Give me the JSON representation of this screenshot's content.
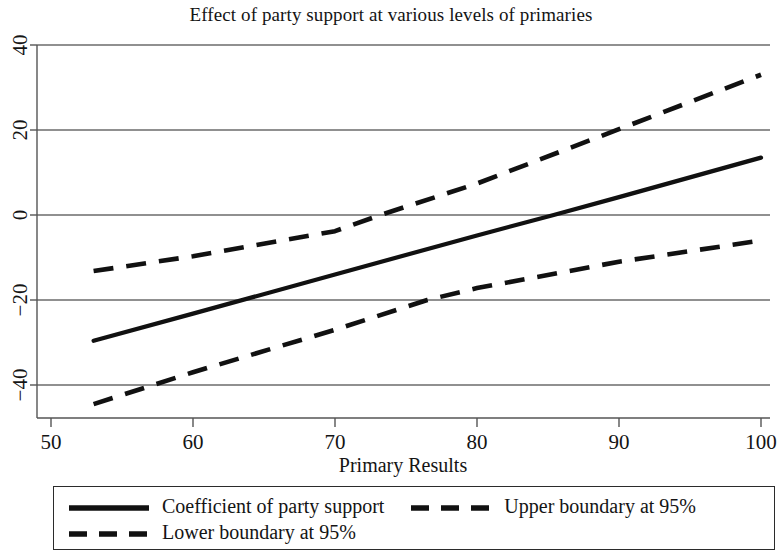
{
  "chart_data": {
    "type": "line",
    "title": "Effect of party support at various levels of primaries",
    "xlabel": "Primary Results",
    "ylabel": "",
    "xlim": [
      50,
      100
    ],
    "ylim": [
      -40,
      40
    ],
    "xticks": [
      50,
      60,
      70,
      80,
      90,
      100
    ],
    "yticks": [
      40,
      20,
      0,
      -20,
      -40
    ],
    "xtick_labels": [
      "50",
      "60",
      "70",
      "80",
      "90",
      "100"
    ],
    "ytick_labels": [
      "40",
      "20",
      "0",
      "−20",
      "−40"
    ],
    "grid": "horizontal",
    "legend_position": "below",
    "series": [
      {
        "name": "Coefficient of party support",
        "style": "solid",
        "color": "#111111",
        "x": [
          53,
          60,
          70,
          80,
          85.4,
          90,
          100
        ],
        "values": [
          -29.6,
          -23.2,
          -14.0,
          -4.8,
          0.0,
          4.2,
          13.5
        ]
      },
      {
        "name": "Upper boundary at 95%",
        "style": "dashed",
        "color": "#111111",
        "x": [
          53,
          60,
          70,
          73.2,
          80,
          90,
          100
        ],
        "values": [
          -13.2,
          -9.7,
          -3.8,
          0.0,
          7.4,
          20.2,
          33.0
        ]
      },
      {
        "name": "Lower boundary at 95%",
        "style": "dashed",
        "color": "#111111",
        "x": [
          53,
          60,
          70,
          76.5,
          80,
          90,
          100
        ],
        "values": [
          -44.5,
          -37.0,
          -27.0,
          -20.0,
          -17.2,
          -11.0,
          -6.0
        ]
      }
    ]
  },
  "legend": {
    "rows": [
      [
        {
          "label": "Coefficient of party support",
          "style": "solid"
        },
        {
          "label": "Upper boundary at 95%",
          "style": "dashed"
        }
      ],
      [
        {
          "label": "Lower boundary at 95%",
          "style": "dashed"
        }
      ]
    ]
  }
}
